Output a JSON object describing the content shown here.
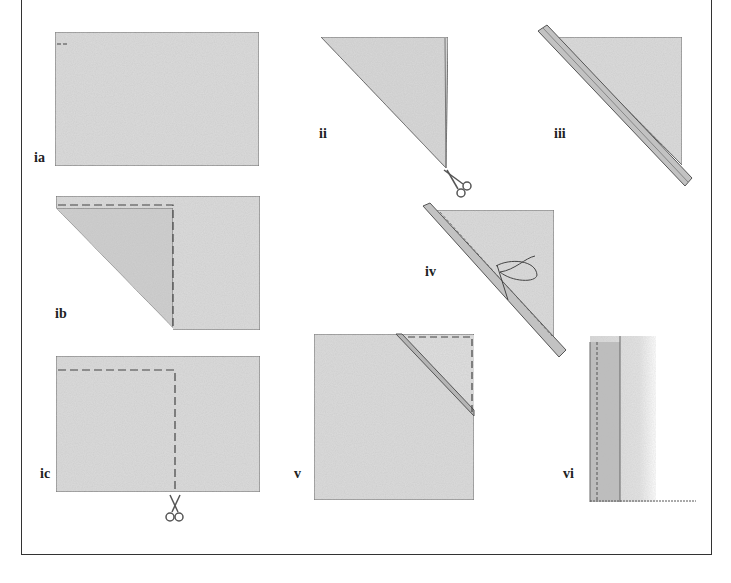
{
  "figure": {
    "panels": [
      {
        "id": "ia",
        "label": "ia",
        "step": "Rectangle of fabric"
      },
      {
        "id": "ib",
        "label": "ib",
        "step": "Fold corner diagonally to form a square"
      },
      {
        "id": "ic",
        "label": "ic",
        "step": "Cut along the marked line to remove excess"
      },
      {
        "id": "ii",
        "label": "ii",
        "step": "Cut folded triangle along the fold"
      },
      {
        "id": "iii",
        "label": "iii",
        "step": "Bias strip laid along diagonal edge"
      },
      {
        "id": "iv",
        "label": "iv",
        "step": "Strip stitched along the diagonal"
      },
      {
        "id": "v",
        "label": "v",
        "step": "Strip attached across corner of square"
      },
      {
        "id": "vi",
        "label": "vi",
        "step": "Finished edge with binding"
      }
    ]
  },
  "colors": {
    "fabric": "#dcdcdc",
    "fabric_dark": "#c8c8c8",
    "outline": "#555555",
    "strip": "#b9b9b9",
    "frame": "#333333"
  }
}
